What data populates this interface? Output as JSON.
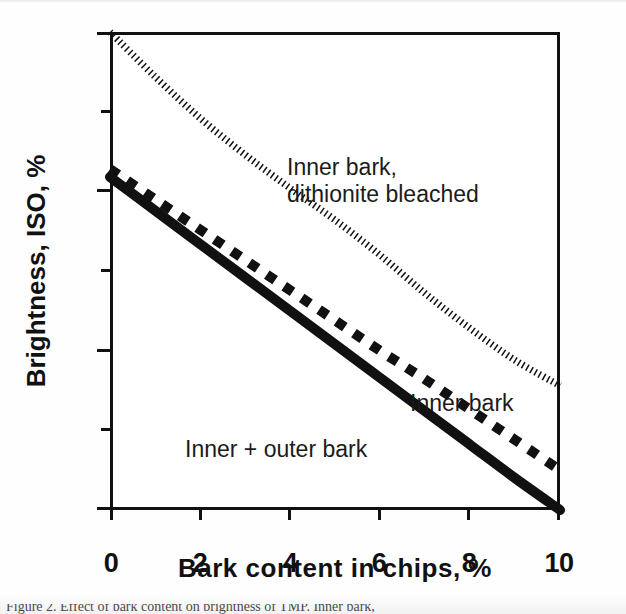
{
  "figure": {
    "caption_fragment": "Figure 2.  Effect of bark content on brightness of TMP. Inner bark,",
    "background_color": "#fefefe",
    "ink_color": "#111111"
  },
  "chart_data": {
    "type": "line",
    "title": "",
    "xlabel": "Bark content in chips, %",
    "ylabel": "Brightness, ISO, %",
    "xlim": [
      0,
      10
    ],
    "ylim": [
      40,
      70
    ],
    "xticks": [
      "0",
      "2",
      "4",
      "6",
      "8",
      "10"
    ],
    "xtick_values": [
      0,
      2,
      4,
      6,
      8,
      10
    ],
    "yticks": [
      "40",
      "50",
      "60",
      "70"
    ],
    "ytick_values": [
      40,
      50,
      60,
      70
    ],
    "ytick_minor_values": [
      45,
      55,
      65
    ],
    "grid": false,
    "legend_position": "inline-annotations",
    "series": [
      {
        "name": "Inner bark, dithionite bleached",
        "label": "Inner bark,\ndithionite bleached",
        "style": "fine-dotted",
        "color": "#111111",
        "x": [
          0,
          1,
          2,
          3,
          4,
          5,
          6,
          7,
          8,
          9,
          10
        ],
        "values": [
          70.0,
          67.2,
          64.6,
          62.3,
          60.2,
          58.2,
          56.0,
          53.6,
          51.4,
          49.4,
          47.8
        ]
      },
      {
        "name": "Inner bark",
        "label": "Inner bark",
        "style": "dashed",
        "color": "#111111",
        "x": [
          0,
          1,
          2,
          3,
          4,
          5,
          6,
          7,
          8,
          9,
          10
        ],
        "values": [
          61.4,
          59.5,
          57.6,
          55.7,
          53.8,
          51.9,
          50.0,
          48.2,
          46.3,
          44.4,
          42.5
        ]
      },
      {
        "name": "Inner + outer bark",
        "label": "Inner + outer bark",
        "style": "solid-thick",
        "color": "#111111",
        "x": [
          0,
          1,
          2,
          3,
          4,
          5,
          6,
          7,
          8,
          9,
          10
        ],
        "values": [
          60.9,
          58.8,
          56.7,
          54.6,
          52.5,
          50.4,
          48.3,
          46.2,
          44.1,
          42.0,
          40.0
        ]
      }
    ]
  }
}
